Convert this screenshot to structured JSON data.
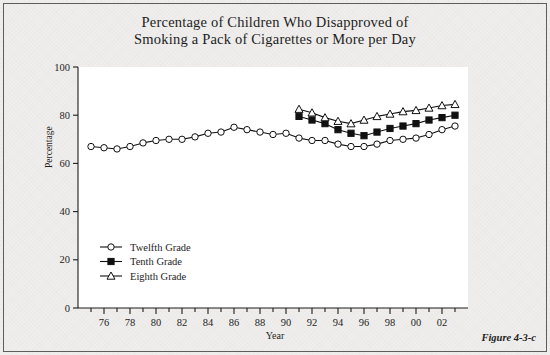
{
  "figure": {
    "caption": "Figure 4-3-c"
  },
  "chart_data": {
    "type": "line",
    "title": "Percentage of Children Who Disapproved of Smoking a Pack of Cigarettes or More per Day",
    "title_line1": "Percentage of Children Who Disapproved of",
    "title_line2": "Smoking a Pack of Cigarettes or More per Day",
    "xlabel": "Year",
    "ylabel": "Percentage",
    "ylim": [
      0,
      100
    ],
    "yticks": [
      0,
      20,
      40,
      60,
      80,
      100
    ],
    "ytick_labels": [
      "0",
      "20",
      "40",
      "60",
      "80",
      "100"
    ],
    "xlim": [
      1974,
      2004
    ],
    "xticks": [
      1976,
      1978,
      1980,
      1982,
      1984,
      1986,
      1988,
      1990,
      1992,
      1994,
      1996,
      1998,
      2000,
      2002
    ],
    "xtick_labels": [
      "76",
      "78",
      "80",
      "82",
      "84",
      "86",
      "88",
      "90",
      "92",
      "94",
      "96",
      "98",
      "00",
      "02"
    ],
    "grid": false,
    "legend_position": "lower-left-inside",
    "series": [
      {
        "name": "Twelfth Grade",
        "marker": "open-circle",
        "x": [
          1975,
          1976,
          1977,
          1978,
          1979,
          1980,
          1981,
          1982,
          1983,
          1984,
          1985,
          1986,
          1987,
          1988,
          1989,
          1990,
          1991,
          1992,
          1993,
          1994,
          1995,
          1996,
          1997,
          1998,
          1999,
          2000,
          2001,
          2002,
          2003
        ],
        "values": [
          67,
          66.5,
          66,
          67,
          68.5,
          69.5,
          70,
          70,
          71,
          72.5,
          73,
          75,
          74,
          73,
          72,
          72.5,
          70.5,
          69.5,
          69.5,
          68,
          67,
          67,
          68,
          69.5,
          70,
          70.5,
          72,
          74,
          75.5
        ]
      },
      {
        "name": "Tenth Grade",
        "marker": "filled-square",
        "x": [
          1991,
          1992,
          1993,
          1994,
          1995,
          1996,
          1997,
          1998,
          1999,
          2000,
          2001,
          2002,
          2003
        ],
        "values": [
          79.5,
          78,
          76.5,
          74,
          72.5,
          71.5,
          73,
          74.5,
          75.5,
          76.5,
          78,
          79,
          80
        ]
      },
      {
        "name": "Eighth Grade",
        "marker": "open-triangle",
        "x": [
          1991,
          1992,
          1993,
          1994,
          1995,
          1996,
          1997,
          1998,
          1999,
          2000,
          2001,
          2002,
          2003
        ],
        "values": [
          82.5,
          81,
          79,
          77.5,
          76.5,
          78,
          79.5,
          80.5,
          81.5,
          82,
          83,
          84,
          84.5
        ]
      }
    ]
  }
}
